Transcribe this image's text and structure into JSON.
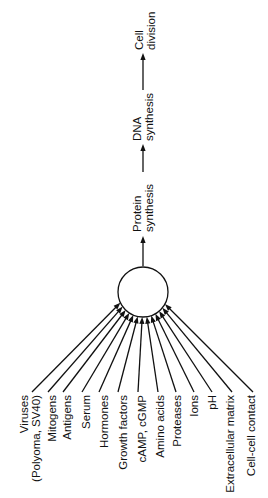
{
  "diagram": {
    "hub": {
      "cx": 143,
      "cy": 292,
      "r": 25
    },
    "pathway": [
      {
        "lines": [
          "Protein",
          "synthesis"
        ],
        "x": 143,
        "y_bottom": 232
      },
      {
        "lines": [
          "DNA",
          "synthesis"
        ],
        "x": 143,
        "y_bottom": 141
      },
      {
        "lines": [
          "Cell",
          "division"
        ],
        "x": 145,
        "y_bottom": 50
      }
    ],
    "pathway_arrows": [
      {
        "x": 143,
        "y1": 266,
        "y2": 236
      },
      {
        "x": 143,
        "y1": 172,
        "y2": 144
      },
      {
        "x": 143,
        "y1": 90,
        "y2": 53
      }
    ],
    "inputs": [
      {
        "lines": [
          "Viruses",
          "(Polyoma, SV40)"
        ],
        "x": 30,
        "end_x": 32,
        "end_y": 392
      },
      {
        "lines": [
          "Mitogens"
        ],
        "x": 52,
        "end_x": 48,
        "end_y": 392
      },
      {
        "lines": [
          "Antigens"
        ],
        "x": 67,
        "end_x": 63,
        "end_y": 392
      },
      {
        "lines": [
          "Serum"
        ],
        "x": 86,
        "end_x": 82,
        "end_y": 392
      },
      {
        "lines": [
          "Hormones"
        ],
        "x": 104,
        "end_x": 99,
        "end_y": 392
      },
      {
        "lines": [
          "Growth factors"
        ],
        "x": 123,
        "end_x": 118,
        "end_y": 392
      },
      {
        "lines": [
          "cAMP, cGMP"
        ],
        "x": 142,
        "end_x": 138,
        "end_y": 392
      },
      {
        "lines": [
          "Amino acids"
        ],
        "x": 160,
        "end_x": 158,
        "end_y": 392
      },
      {
        "lines": [
          "Proteases"
        ],
        "x": 177,
        "end_x": 176,
        "end_y": 392
      },
      {
        "lines": [
          "Ions"
        ],
        "x": 194,
        "end_x": 194,
        "end_y": 392
      },
      {
        "lines": [
          "pH"
        ],
        "x": 212,
        "end_x": 212,
        "end_y": 392
      },
      {
        "lines": [
          "Extracellular matrix"
        ],
        "x": 230,
        "end_x": 232,
        "end_y": 392
      },
      {
        "lines": [
          "Cell-cell contact"
        ],
        "x": 251,
        "end_x": 253,
        "end_y": 392
      }
    ],
    "colors": {
      "ink": "#111111",
      "background": "#ffffff"
    }
  }
}
